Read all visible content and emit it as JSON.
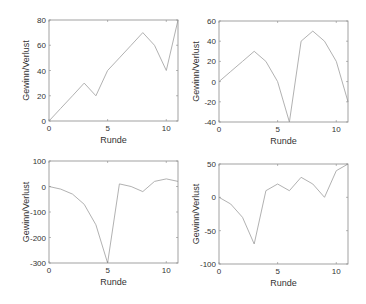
{
  "figure": {
    "background": "#ffffff",
    "axis_color": "#8a8a8a",
    "line_color": "#a8a8a8",
    "text_color": "#333333"
  },
  "chart_data": [
    {
      "type": "line",
      "title": "",
      "xlabel": "Runde",
      "ylabel": "Gewinn/Verlust",
      "x": [
        0,
        1,
        2,
        3,
        4,
        5,
        6,
        7,
        8,
        9,
        10,
        11
      ],
      "series": [
        {
          "name": "",
          "values": [
            0,
            10,
            20,
            30,
            20,
            40,
            50,
            60,
            70,
            60,
            40,
            80
          ]
        }
      ],
      "xlim": [
        0,
        11
      ],
      "ylim": [
        0,
        80
      ],
      "xticks": [
        0,
        5,
        10
      ],
      "yticks": [
        0,
        20,
        40,
        60,
        80
      ],
      "grid": false,
      "box": {
        "left": 49,
        "top": 20,
        "right": 178,
        "bottom": 121
      }
    },
    {
      "type": "line",
      "title": "",
      "xlabel": "Runde",
      "ylabel": "Gewinn/Verlust",
      "x": [
        0,
        1,
        2,
        3,
        4,
        5,
        6,
        7,
        8,
        9,
        10,
        11
      ],
      "series": [
        {
          "name": "",
          "values": [
            0,
            10,
            20,
            30,
            20,
            0,
            -40,
            40,
            50,
            40,
            20,
            -20
          ]
        }
      ],
      "xlim": [
        0,
        11
      ],
      "ylim": [
        -40,
        60
      ],
      "xticks": [
        0,
        5,
        10
      ],
      "yticks": [
        -40,
        -20,
        0,
        20,
        40,
        60
      ],
      "grid": false,
      "box": {
        "left": 219,
        "top": 21,
        "right": 348,
        "bottom": 122
      }
    },
    {
      "type": "line",
      "title": "",
      "xlabel": "Runde",
      "ylabel": "Gewinn/Verlust",
      "x": [
        0,
        1,
        2,
        3,
        4,
        5,
        6,
        7,
        8,
        9,
        10,
        11
      ],
      "series": [
        {
          "name": "",
          "values": [
            0,
            -10,
            -30,
            -70,
            -150,
            -300,
            10,
            0,
            -20,
            20,
            30,
            20
          ]
        }
      ],
      "xlim": [
        0,
        11
      ],
      "ylim": [
        -300,
        100
      ],
      "xticks": [
        0,
        5,
        10
      ],
      "yticks": [
        -300,
        -200,
        -100,
        0,
        100
      ],
      "grid": false,
      "box": {
        "left": 49,
        "top": 161,
        "right": 178,
        "bottom": 263
      }
    },
    {
      "type": "line",
      "title": "",
      "xlabel": "Runde",
      "ylabel": "Gewinn/Verlust",
      "x": [
        0,
        1,
        2,
        3,
        4,
        5,
        6,
        7,
        8,
        9,
        10,
        11
      ],
      "series": [
        {
          "name": "",
          "values": [
            0,
            -10,
            -30,
            -70,
            10,
            20,
            10,
            30,
            20,
            0,
            40,
            50
          ]
        }
      ],
      "xlim": [
        0,
        11
      ],
      "ylim": [
        -100,
        50
      ],
      "xticks": [
        0,
        5,
        10
      ],
      "yticks": [
        -100,
        -50,
        0,
        50
      ],
      "grid": false,
      "box": {
        "left": 219,
        "top": 164,
        "right": 348,
        "bottom": 264
      }
    }
  ]
}
